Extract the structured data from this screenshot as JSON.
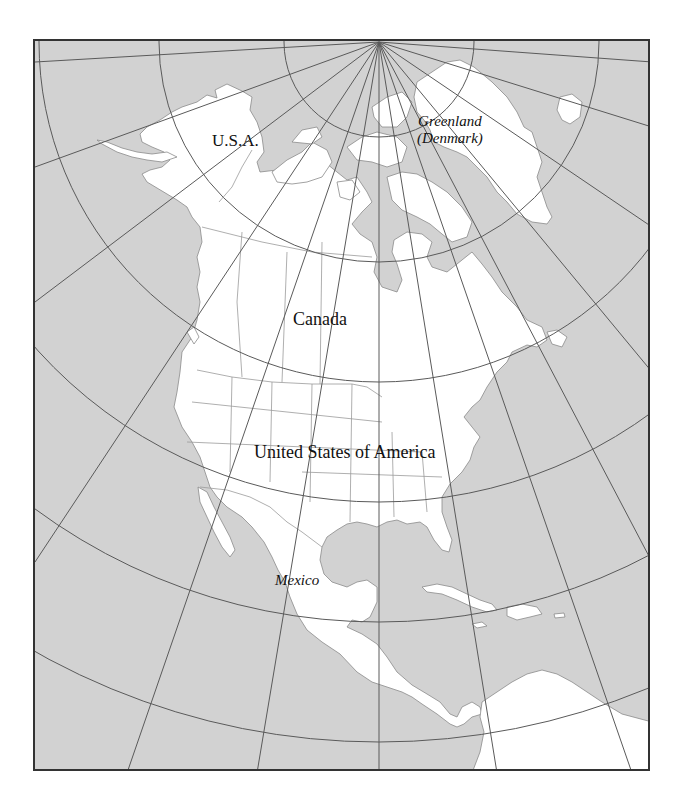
{
  "map": {
    "title": "North America outline map",
    "projection": "polar azimuthal with graticule",
    "colors": {
      "ocean": "#d2d2d2",
      "land": "#ffffff",
      "graticule": "#5a5a5a",
      "borders": "#9a9a9a",
      "frame": "#333333",
      "text": "#111111"
    },
    "labels": {
      "usa_alaska": "U.S.A.",
      "greenland_line1": "Greenland",
      "greenland_line2": "(Denmark)",
      "canada": "Canada",
      "usa": "United States of America",
      "mexico": "Mexico"
    },
    "pole_point": [
      377,
      40
    ]
  }
}
